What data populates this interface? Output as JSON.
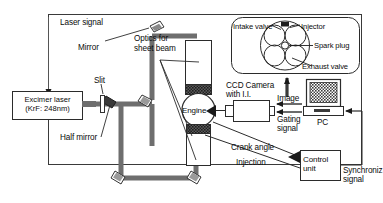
{
  "figure": {
    "type": "schematic-diagram"
  },
  "labels": {
    "laser_signal": "Laser signal",
    "mirror": "Mirror",
    "optics_sheet_beam": "Optics for sheet beam",
    "optics_sheet_beam_l1": "Optics for",
    "optics_sheet_beam_l2": "sheet beam",
    "slit": "Slit",
    "half_mirror": "Half mirror",
    "engine": "Engine",
    "ccd_camera_l1": "CCD Camera",
    "ccd_camera_l2": "with I.I.",
    "image": "Image",
    "gating_signal_l1": "Gating",
    "gating_signal_l2": "signal",
    "pc": "PC",
    "crank_angle": "Crank angle",
    "injection": "Injection",
    "control_unit_l1": "Control",
    "control_unit_l2": "unit",
    "synchroniz_l1": "Synchroniz",
    "synchroniz_l2": "signal"
  },
  "excimer_laser": {
    "line1": "Excimer laser",
    "line2": "(KrF: 248nm)"
  },
  "cylinder_head_inset": {
    "intake_valve": "Intake valve",
    "injector": "Injector",
    "spark_plug": "Spark plug",
    "exhaust_valve": "Exhaust valve"
  },
  "colors": {
    "line": "#2b2b2b",
    "beam": "#6e6e6e",
    "beam_dark": "#4a4a4a",
    "fill_white": "#ffffff",
    "screen": "#4d4d4d",
    "border": "#3a3a3a"
  }
}
